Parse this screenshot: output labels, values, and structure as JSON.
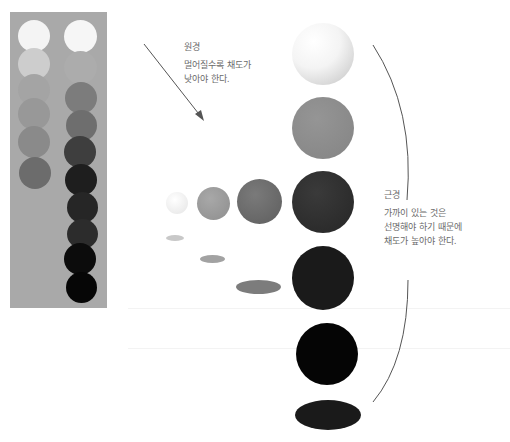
{
  "far": {
    "title": "원경",
    "lines": [
      "멀어질수록 채도가",
      "낮아야 한다."
    ]
  },
  "near": {
    "title": "근경",
    "lines": [
      "가까이 있는 것은",
      "선명해야 하기 때문에",
      "채도가 높아야 한다."
    ]
  },
  "colors": {
    "panel_bg": "#a9a9a9",
    "text": "#6a6a6a",
    "line": "#555555"
  },
  "swatch_panel": {
    "left_column": [
      "#f4f4f4",
      "#cdcdcd",
      "#a4a4a4",
      "#989898",
      "#8a8a8a",
      "#6c6c6c"
    ],
    "right_column": [
      "#f6f6f6",
      "#acacac",
      "#7c7c7c",
      "#6e6e6e",
      "#3e3e3e",
      "#1e1e1e",
      "#262626",
      "#2c2c2c",
      "#0c0c0c",
      "#060606"
    ]
  },
  "large_spheres": [
    "#ededed",
    "#8d8d8d",
    "#333333",
    "#1a1a1a",
    "#050505"
  ],
  "mid_spheres": [
    "#efefef",
    "#9c9c9c",
    "#6f6f6f"
  ],
  "shadows": [
    "#c6c6c6",
    "#a0a0a0",
    "#7a7a7a",
    "#1a1a1a"
  ]
}
